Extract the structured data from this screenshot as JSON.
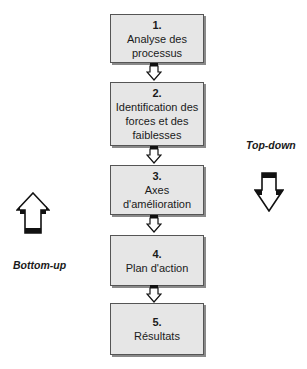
{
  "steps": [
    {
      "number": "1.",
      "label": "Analyse des processus"
    },
    {
      "number": "2.",
      "label": "Identification des forces et des faiblesses"
    },
    {
      "number": "3.",
      "label": "Axes d'amélioration"
    },
    {
      "number": "4.",
      "label": "Plan d'action"
    },
    {
      "number": "5.",
      "label": "Résultats"
    }
  ],
  "side_labels": {
    "left": "Bottom-up",
    "right": "Top-down"
  },
  "icons": {
    "connector": "hollow-down-arrow-icon",
    "left": "hollow-up-arrow-icon",
    "right": "hollow-down-arrow-icon"
  },
  "colors": {
    "box_fill": "#e6e6e6",
    "box_border": "#555555",
    "shadow": "#8a8a8a"
  }
}
